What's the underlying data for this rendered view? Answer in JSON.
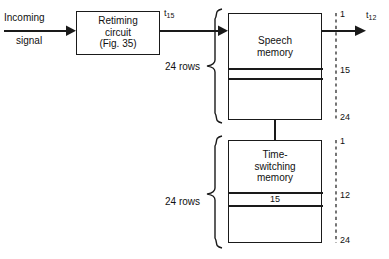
{
  "diagram": {
    "input": {
      "line1": "Incoming",
      "line2": "signal"
    },
    "retiming": {
      "line1": "Retiming",
      "line2": "circuit",
      "line3": "(Fig. 35)"
    },
    "signal_in_label": {
      "base": "t",
      "sub": "15"
    },
    "signal_out_label": {
      "base": "t",
      "sub": "12"
    },
    "speech_memory": {
      "line1": "Speech",
      "line2": "memory",
      "rows_label": "24 rows",
      "band_value": "",
      "ticks": [
        {
          "value": "1"
        },
        {
          "value": "15"
        },
        {
          "value": "24"
        }
      ]
    },
    "time_switching_memory": {
      "line1": "Time-",
      "line2": "switching",
      "line3": "memory",
      "rows_label": "24 rows",
      "band_value": "15",
      "ticks": [
        {
          "value": "1"
        },
        {
          "value": "12"
        },
        {
          "value": "24"
        }
      ]
    },
    "colors": {
      "ink": "#1a1a1a",
      "paper": "#ffffff"
    }
  }
}
